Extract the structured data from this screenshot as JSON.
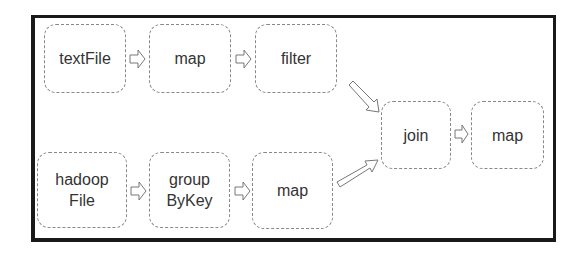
{
  "diagram": {
    "title": "",
    "nodes": [
      {
        "id": "textFile",
        "label": "textFile"
      },
      {
        "id": "map1",
        "label": "map"
      },
      {
        "id": "filter",
        "label": "filter"
      },
      {
        "id": "hadoopFile",
        "label": "hadoop\nFile",
        "line1": "hadoop",
        "line2": "File"
      },
      {
        "id": "groupByKey",
        "label": "group\nByKey",
        "line1": "group",
        "line2": "ByKey"
      },
      {
        "id": "map2",
        "label": "map"
      },
      {
        "id": "join",
        "label": "join"
      },
      {
        "id": "map3",
        "label": "map"
      }
    ],
    "edges": [
      {
        "from": "textFile",
        "to": "map1"
      },
      {
        "from": "map1",
        "to": "filter"
      },
      {
        "from": "filter",
        "to": "join"
      },
      {
        "from": "hadoopFile",
        "to": "groupByKey"
      },
      {
        "from": "groupByKey",
        "to": "map2"
      },
      {
        "from": "map2",
        "to": "join"
      },
      {
        "from": "join",
        "to": "map3"
      }
    ],
    "colors": {
      "frame": "#1a1a1a",
      "node_border": "#888888",
      "text": "#333333",
      "arrow": "#777777"
    }
  }
}
